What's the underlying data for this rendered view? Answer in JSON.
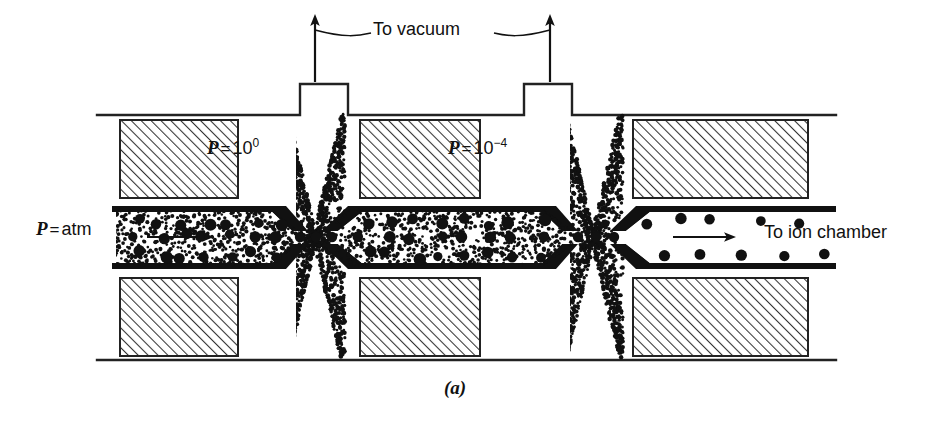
{
  "figure": {
    "caption": "(a)",
    "background_color": "#ffffff",
    "ink_color": "#111111"
  },
  "labels": {
    "source_pressure": {
      "symbol": "P",
      "equals": "=",
      "value": "atm"
    },
    "stage1_pressure": {
      "symbol": "P",
      "equals": "=",
      "base": "10",
      "exponent": "0"
    },
    "stage2_pressure": {
      "symbol": "P",
      "equals": "=",
      "base": "10",
      "exponent": "−4"
    },
    "vacuum_port": "To vacuum",
    "outlet": "To ion chamber"
  },
  "stages": [
    {
      "name": "source-expansion-stage",
      "pressure_text": "P = atm",
      "particle_density": "dense",
      "has_flow_arrow": true
    },
    {
      "name": "first-pumping-stage",
      "pressure_text": "P = 10⁰",
      "particle_density": "dense",
      "has_flow_arrow": false
    },
    {
      "name": "second-pumping-stage",
      "pressure_text": "P = 10⁻⁴",
      "particle_density": "sparse",
      "has_flow_arrow": true
    }
  ],
  "elements": {
    "vacuum_ports": 2,
    "hatched_blocks": 6,
    "skimmer_cones": 3,
    "spray_clouds": 2,
    "flow_arrows": 2
  },
  "colors": {
    "solid_metal": "#111111",
    "hatch_line": "#333333",
    "stipple": "#111111",
    "outline": "#222222"
  }
}
